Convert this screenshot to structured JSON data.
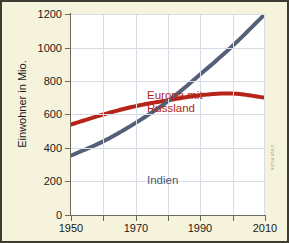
{
  "figure": {
    "background_color": "#f6f3dc",
    "border_color": "#3c3c32",
    "credit": "93734-478-3"
  },
  "chart_data": {
    "type": "line",
    "title": "",
    "xlabel": "",
    "ylabel": "Einwohner in Mio.",
    "xlim": [
      1950,
      2010
    ],
    "ylim": [
      0,
      1200
    ],
    "grid": true,
    "legend_position": "inline-annotations",
    "x_ticks": [
      1950,
      1960,
      1970,
      1980,
      1990,
      2000,
      2010
    ],
    "x_tick_labels": [
      "1950",
      "",
      "1970",
      "",
      "1990",
      "",
      "2010"
    ],
    "y_ticks": [
      0,
      200,
      400,
      600,
      800,
      1000,
      1200
    ],
    "y_tick_labels": [
      "0",
      "200",
      "400",
      "600",
      "800",
      "1000",
      "1200"
    ],
    "x": [
      1950,
      1960,
      1970,
      1980,
      1990,
      2000,
      2010
    ],
    "series": [
      {
        "name": "Europa mit Russland",
        "label_text": "Europa mit\nRussland",
        "color": "#b8241a",
        "values": [
          540,
          600,
          650,
          685,
          715,
          725,
          700
        ]
      },
      {
        "name": "Indien",
        "label_text": "Indien",
        "color": "#545f78",
        "values": [
          355,
          440,
          550,
          680,
          840,
          1010,
          1200
        ]
      }
    ]
  }
}
